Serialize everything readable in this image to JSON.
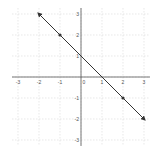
{
  "chart_data": {
    "type": "line",
    "title": "",
    "xlabel": "",
    "ylabel": "",
    "xlim": [
      -3,
      3
    ],
    "ylim": [
      -3,
      3
    ],
    "grid": true,
    "x_ticks": [
      "-3",
      "-2",
      "-1",
      "0",
      "1",
      "2",
      "3"
    ],
    "y_ticks": [
      "3",
      "2",
      "1",
      "-1",
      "-2",
      "-3"
    ],
    "series": [
      {
        "name": "line",
        "equation": "y = -x + 1",
        "x": [
          -2,
          -1,
          0,
          1,
          2,
          3
        ],
        "y": [
          3,
          2,
          1,
          0,
          -1,
          -2
        ],
        "marked_points": [
          [
            -1,
            2
          ],
          [
            2,
            -1
          ]
        ],
        "arrows_both_ends": true
      }
    ]
  },
  "colors": {
    "grid": "#d9d9d9",
    "axis": "#555555",
    "line": "#333333"
  }
}
